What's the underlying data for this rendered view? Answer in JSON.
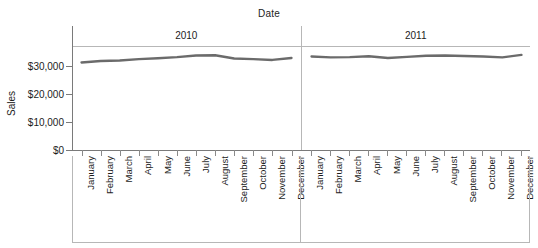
{
  "chart_data": {
    "type": "line",
    "title": "",
    "xlabel": "Date",
    "ylabel": "Sales",
    "facet_label": "Date",
    "facets": [
      "2010",
      "2011"
    ],
    "categories": [
      "January",
      "February",
      "March",
      "April",
      "May",
      "June",
      "July",
      "August",
      "September",
      "October",
      "November",
      "December"
    ],
    "series": [
      {
        "name": "2010",
        "facet": "2010",
        "values": [
          31500,
          32000,
          32200,
          32700,
          33000,
          33400,
          34000,
          34050,
          32900,
          32700,
          32400,
          33100
        ]
      },
      {
        "name": "2011",
        "facet": "2011",
        "values": [
          33600,
          33300,
          33400,
          33700,
          33100,
          33500,
          33900,
          34000,
          33800,
          33600,
          33300,
          34200
        ]
      }
    ],
    "ylim": [
      0,
      37000
    ],
    "yticks": [
      0,
      10000,
      20000,
      30000
    ],
    "ytick_labels": [
      "$0",
      "$10,000",
      "$20,000",
      "$30,000"
    ],
    "grid": false,
    "legend": "none",
    "line_color": "#6b6b6b",
    "axis_color": "#7a7a7a",
    "panel_border_color": "#b7b7b7",
    "text_color": "#1c1c1c"
  }
}
